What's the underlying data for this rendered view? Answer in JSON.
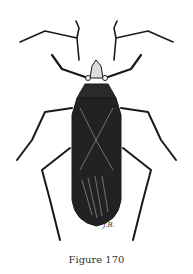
{
  "figure": {
    "caption": "Figure 170",
    "artist_initials": "J.B."
  },
  "colors": {
    "ink": "#1a1a1a",
    "body_dark": "#222222",
    "paper": "#ffffff"
  }
}
